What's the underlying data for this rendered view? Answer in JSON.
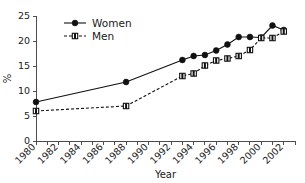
{
  "chart_data": {
    "type": "line",
    "title": "",
    "xlabel": "Year",
    "ylabel": "%",
    "xlim": [
      1980,
      2003
    ],
    "ylim": [
      0,
      25
    ],
    "yticks": [
      0,
      5,
      10,
      15,
      20,
      25
    ],
    "ytick_labels": [
      "0",
      "5",
      "10",
      "15",
      "20",
      "25"
    ],
    "xticks": [
      1980,
      1981,
      1982,
      1983,
      1984,
      1985,
      1986,
      1987,
      1988,
      1989,
      1990,
      1991,
      1992,
      1993,
      1994,
      1995,
      1996,
      1997,
      1998,
      1999,
      2000,
      2001,
      2002,
      2003
    ],
    "xtick_labels": [
      "1980",
      "1982",
      "1984",
      "1986",
      "1988",
      "1990",
      "1992",
      "1994",
      "1996",
      "1998",
      "2000",
      "2002"
    ],
    "xtick_label_years": [
      1980,
      1982,
      1984,
      1986,
      1988,
      1990,
      1992,
      1994,
      1996,
      1998,
      2000,
      2002
    ],
    "grid": false,
    "legend_position": "top-left",
    "series": [
      {
        "name": "Women",
        "marker": "filled-circle",
        "linestyle": "solid",
        "color": "#111111",
        "x": [
          1980,
          1988,
          1993,
          1994,
          1995,
          1996,
          1997,
          1998,
          1999,
          2000,
          2001,
          2002
        ],
        "values": [
          7.8,
          11.8,
          16.2,
          17.0,
          17.2,
          18.1,
          19.3,
          20.8,
          20.8,
          20.7,
          23.1,
          22.2
        ]
      },
      {
        "name": "Men",
        "marker": "open-square",
        "linestyle": "dashed",
        "color": "#111111",
        "x": [
          1980,
          1988,
          1993,
          1994,
          1995,
          1996,
          1997,
          1998,
          1999,
          2000,
          2001,
          2002
        ],
        "values": [
          6.0,
          7.0,
          13.0,
          13.5,
          15.1,
          16.1,
          16.5,
          17.0,
          18.2,
          20.6,
          20.6,
          21.9
        ]
      }
    ]
  },
  "legend": {
    "items": [
      {
        "label": "Women"
      },
      {
        "label": "Men"
      }
    ]
  }
}
